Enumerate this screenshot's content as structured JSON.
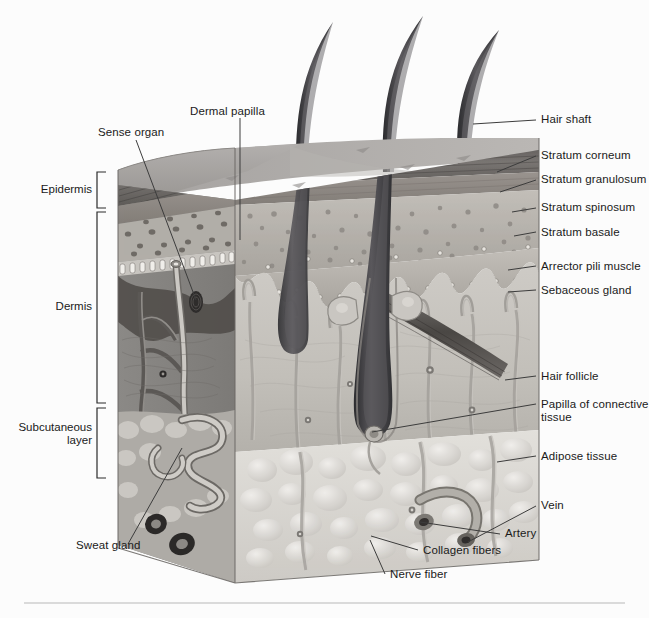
{
  "figure": {
    "background_color": "#fcfcfc",
    "text_color": "#1a1a1a",
    "leader_line_color": "#3c3c3c",
    "rule_color": "#b8b8b8"
  },
  "layer_brackets": [
    {
      "name": "epidermis",
      "label": "Epidermis"
    },
    {
      "name": "dermis",
      "label": "Dermis"
    },
    {
      "name": "subcutaneous-layer",
      "label": "Subcutaneous\nlayer"
    }
  ],
  "left_labels": [
    {
      "name": "dermal-papilla",
      "label": "Dermal papilla"
    },
    {
      "name": "sense-organ",
      "label": "Sense organ"
    },
    {
      "name": "sweat-gland",
      "label": "Sweat gland"
    }
  ],
  "right_labels": [
    {
      "name": "hair-shaft",
      "label": "Hair shaft"
    },
    {
      "name": "stratum-corneum",
      "label": "Stratum corneum"
    },
    {
      "name": "stratum-granulosum",
      "label": "Stratum granulosum"
    },
    {
      "name": "stratum-spinosum",
      "label": "Stratum spinosum"
    },
    {
      "name": "stratum-basale",
      "label": "Stratum basale"
    },
    {
      "name": "arrector-pili-muscle",
      "label": "Arrector pili muscle"
    },
    {
      "name": "sebaceous-gland",
      "label": "Sebaceous gland"
    },
    {
      "name": "hair-follicle",
      "label": "Hair follicle"
    },
    {
      "name": "papilla-of-connective-tissue",
      "label": "Papilla of connective tissue"
    },
    {
      "name": "adipose-tissue",
      "label": "Adipose tissue"
    },
    {
      "name": "vein",
      "label": "Vein"
    },
    {
      "name": "artery",
      "label": "Artery"
    }
  ],
  "bottom_labels": [
    {
      "name": "collagen-fibers",
      "label": "Collagen fibers"
    },
    {
      "name": "nerve-fiber",
      "label": "Nerve fiber"
    }
  ],
  "labels": {
    "epidermis": "Epidermis",
    "dermis": "Dermis",
    "subcutaneous_line1": "Subcutaneous",
    "subcutaneous_line2": "layer",
    "dermal_papilla": "Dermal papilla",
    "sense_organ": "Sense organ",
    "sweat_gland": "Sweat gland",
    "hair_shaft": "Hair shaft",
    "stratum_corneum": "Stratum corneum",
    "stratum_granulosum": "Stratum granulosum",
    "stratum_spinosum": "Stratum spinosum",
    "stratum_basale": "Stratum basale",
    "arrector_pili_muscle": "Arrector pili muscle",
    "sebaceous_gland": "Sebaceous gland",
    "hair_follicle": "Hair follicle",
    "papilla_of_connective_tissue": "Papilla of connective tissue",
    "adipose_tissue": "Adipose tissue",
    "vein": "Vein",
    "artery": "Artery",
    "collagen_fibers": "Collagen fibers",
    "nerve_fiber": "Nerve fiber"
  },
  "illustration": {
    "style": "grayscale anatomical cutaway block of skin",
    "hair_shaft_count": 3,
    "palette": {
      "stratum_corneum": "#6d6a68",
      "stratum_granulosum": "#8e8a88",
      "stratum_spinosum": "#b4b0ac",
      "stratum_basale": "#9a968f",
      "skin_surface": "#a9a6a4",
      "dermis_cut_face": "#8c8a88",
      "dermis_front_face": "#c3c0bb",
      "subcutaneous_fat": "#d9d7d2",
      "hair": "#3a3a3c",
      "vessel_dark": "#6a6663",
      "vessel_light": "#b9b6b1"
    }
  }
}
